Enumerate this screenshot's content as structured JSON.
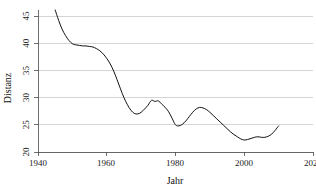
{
  "chart_data": {
    "type": "line",
    "title": "",
    "xlabel": "Jahr",
    "ylabel": "Distanz",
    "xlim": [
      1940,
      2020
    ],
    "ylim": [
      20,
      46
    ],
    "grid": "horizontal",
    "legend": "none",
    "xticks": [
      1940,
      1960,
      1980,
      2000,
      2020
    ],
    "xtick_labels": [
      "1940",
      "1960",
      "1980",
      "2000",
      "2020"
    ],
    "yticks": [
      20,
      25,
      30,
      35,
      40,
      45
    ],
    "ytick_labels": [
      "20",
      "25",
      "30",
      "35",
      "40",
      "45"
    ],
    "series": [
      {
        "name": "Distanz",
        "color": "#111111",
        "x": [
          1945,
          1946,
          1947,
          1948,
          1949,
          1950,
          1951,
          1952,
          1953,
          1954,
          1955,
          1956,
          1957,
          1958,
          1959,
          1960,
          1961,
          1962,
          1963,
          1964,
          1965,
          1966,
          1967,
          1968,
          1969,
          1970,
          1971,
          1972,
          1973,
          1974,
          1975,
          1976,
          1977,
          1978,
          1979,
          1980,
          1981,
          1982,
          1983,
          1984,
          1985,
          1986,
          1987,
          1988,
          1989,
          1990,
          1991,
          1992,
          1993,
          1994,
          1995,
          1996,
          1997,
          1998,
          1999,
          2000,
          2001,
          2002,
          2003,
          2004,
          2005,
          2006,
          2007,
          2008,
          2009,
          2010
        ],
        "y": [
          46.1,
          44.2,
          42.6,
          41.4,
          40.5,
          39.9,
          39.7,
          39.6,
          39.5,
          39.5,
          39.4,
          39.3,
          39.0,
          38.6,
          38.0,
          37.2,
          36.2,
          34.9,
          33.3,
          31.6,
          30.0,
          28.7,
          27.7,
          27.1,
          27.0,
          27.3,
          27.9,
          28.6,
          29.5,
          29.3,
          29.4,
          28.8,
          28.2,
          27.4,
          26.2,
          25.0,
          24.8,
          25.1,
          25.7,
          26.5,
          27.3,
          27.9,
          28.2,
          28.1,
          27.8,
          27.3,
          26.7,
          26.1,
          25.5,
          24.9,
          24.3,
          23.7,
          23.2,
          22.8,
          22.4,
          22.2,
          22.3,
          22.5,
          22.7,
          22.8,
          22.7,
          22.7,
          22.9,
          23.3,
          24.0,
          24.8
        ]
      }
    ]
  },
  "axis": {
    "y_title": "Distanz",
    "x_title": "Jahr"
  },
  "caption": {
    "remnant": ""
  }
}
